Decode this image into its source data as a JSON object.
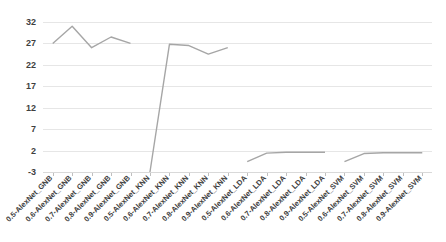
{
  "chart_data": {
    "type": "line",
    "title": "",
    "subtitle": "",
    "xlabel": "",
    "ylabel": "",
    "ylim": [
      -3,
      32
    ],
    "yticks": [
      -3,
      2,
      7,
      12,
      17,
      22,
      27,
      32
    ],
    "ytick_labels": [
      "-3",
      "2",
      "7",
      "12",
      "17",
      "22",
      "27",
      "32"
    ],
    "grid": true,
    "legend": false,
    "legend_position": "none",
    "line_color": "#a6a6a6",
    "line_width": 1.4,
    "categories": [
      "0.5-AlexNet_GNB",
      "0.6-AlexNet_GNB",
      "0.7-AlexNet_GNB",
      "0.8-AlexNet_GNB",
      "0.9-AlexNet_GNB",
      "0.5-AlexNet_KNN",
      "0.6-AlexNet_KNN",
      "0.7-AlexNet_KNN",
      "0.8-AlexNet_KNN",
      "0.9-AlexNet_KNN",
      "0.5-AlexNet_LDA",
      "0.6-AlexNet_LDA",
      "0.7-AlexNet_LDA",
      "0.8-AlexNet_LDA",
      "0.9-AlexNet_LDA",
      "0.5-AlexNet_SVM",
      "0.6-AlexNet_SVM",
      "0.7-AlexNet_SVM",
      "0.8-AlexNet_SVM",
      "0.9-AlexNet_SVM"
    ],
    "series": [
      {
        "name": "value",
        "values": [
          27.0,
          31.0,
          26.0,
          28.5,
          27.0,
          -3.0,
          26.8,
          26.5,
          24.5,
          26.0,
          26.3,
          -0.6,
          1.4,
          1.6,
          1.6,
          1.6,
          -0.6,
          1.3,
          1.5,
          1.5
        ]
      }
    ],
    "groups": [
      {
        "name": "GNB",
        "start_index": 0,
        "labels": [
          "0.5-AlexNet_GNB",
          "0.6-AlexNet_GNB",
          "0.7-AlexNet_GNB",
          "0.8-AlexNet_GNB",
          "0.9-AlexNet_GNB"
        ],
        "values": [
          27.0,
          31.0,
          26.0,
          28.5,
          27.0
        ]
      },
      {
        "name": "KNN",
        "start_index": 5,
        "labels": [
          "0.5-AlexNet_KNN",
          "0.6-AlexNet_KNN",
          "0.7-AlexNet_KNN",
          "0.8-AlexNet_KNN",
          "0.9-AlexNet_KNN"
        ],
        "values": [
          -3.0,
          26.8,
          26.5,
          24.5,
          26.0
        ]
      },
      {
        "name": "LDA",
        "start_index": 10,
        "labels": [
          "0.5-AlexNet_LDA",
          "0.6-AlexNet_LDA",
          "0.7-AlexNet_LDA",
          "0.8-AlexNet_LDA",
          "0.9-AlexNet_LDA"
        ],
        "values": [
          -0.6,
          1.4,
          1.6,
          1.6,
          1.6
        ]
      },
      {
        "name": "SVM",
        "start_index": 15,
        "labels": [
          "0.5-AlexNet_SVM",
          "0.6-AlexNet_SVM",
          "0.7-AlexNet_SVM",
          "0.8-AlexNet_SVM",
          "0.9-AlexNet_SVM"
        ],
        "values": [
          -0.6,
          1.3,
          1.5,
          1.5,
          1.5
        ]
      }
    ]
  }
}
